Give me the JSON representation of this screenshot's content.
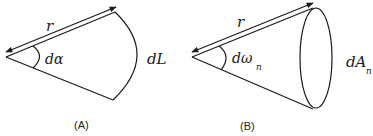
{
  "panels": [
    {
      "id": "A",
      "caption": "(A)",
      "radius_label": "r",
      "angle_label": "dα",
      "arc_label": "dL",
      "kind": "planar-angle"
    },
    {
      "id": "B",
      "caption": "(B)",
      "radius_label": "r",
      "angle_label": "dω",
      "angle_subscript": "n",
      "area_label": "dA",
      "area_subscript": "n",
      "kind": "solid-angle"
    }
  ]
}
